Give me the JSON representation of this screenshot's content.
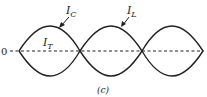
{
  "figure": {
    "caption": "(c)",
    "axis_label": "0",
    "labels": {
      "ic_main": "I",
      "ic_sub": "C",
      "il_main": "I",
      "il_sub": "L",
      "it_main": "I",
      "it_sub": "T"
    },
    "colors": {
      "line": "#222222",
      "background": "#ffffff"
    }
  }
}
